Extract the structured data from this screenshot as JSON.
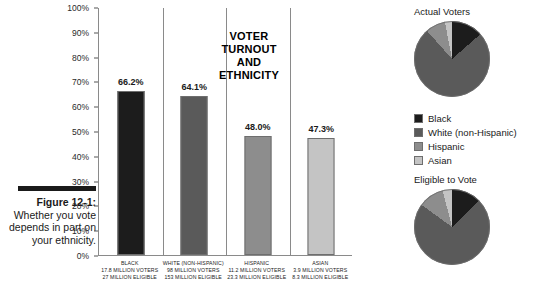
{
  "caption": {
    "figure_label": "Figure 12-1:",
    "text": "Whether you vote depends in part on your ethnicity."
  },
  "chart_title": "VOTER TURNOUT AND ETHNICITY",
  "legend": {
    "items": [
      {
        "label": "Black",
        "color": "#1c1c1c"
      },
      {
        "label": "White (non-Hispanic)",
        "color": "#5a5a5a"
      },
      {
        "label": "Hispanic",
        "color": "#8d8d8d"
      },
      {
        "label": "Asian",
        "color": "#c4c4c4"
      }
    ]
  },
  "pies": [
    {
      "title": "Actual Voters"
    },
    {
      "title": "Eligible to Vote"
    }
  ],
  "chart_data": [
    {
      "type": "bar",
      "title": "VOTER TURNOUT AND ETHNICITY",
      "xlabel": "",
      "ylabel": "",
      "ylim": [
        0,
        100
      ],
      "grid": false,
      "ytick_labels": [
        "100%",
        "90%",
        "80%",
        "70%",
        "60%",
        "50%",
        "40%",
        "30%",
        "20%",
        "10%",
        "0%"
      ],
      "ytick_values": [
        100,
        90,
        80,
        70,
        60,
        50,
        40,
        30,
        20,
        10,
        0
      ],
      "categories": [
        "BLACK",
        "WHITE (NON-HISPANIC)",
        "HISPANIC",
        "ASIAN"
      ],
      "values": [
        66.2,
        64.1,
        48.0,
        47.3
      ],
      "value_labels": [
        "66.2%",
        "64.1%",
        "48.0%",
        "47.3%"
      ],
      "bar_colors": [
        "#1c1c1c",
        "#5a5a5a",
        "#8d8d8d",
        "#c4c4c4"
      ],
      "category_details": [
        {
          "name": "BLACK",
          "voters": "17.8 MILLION VOTERS",
          "eligible": "27 MILLION ELIGIBLE"
        },
        {
          "name": "WHITE (NON-HISPANIC)",
          "voters": "98 MILLION VOTERS",
          "eligible": "153 MILLION ELIGIBLE"
        },
        {
          "name": "HISPANIC",
          "voters": "11.2 MILLION VOTERS",
          "eligible": "23.3 MILLION ELIGIBLE"
        },
        {
          "name": "ASIAN",
          "voters": "3.9 MILLION VOTERS",
          "eligible": "8.3 MILLION ELIGIBLE"
        }
      ]
    },
    {
      "type": "pie",
      "title": "Actual Voters",
      "legend_position": "below",
      "categories": [
        "Black",
        "White (non-Hispanic)",
        "Hispanic",
        "Asian"
      ],
      "values": [
        13.5,
        74.5,
        8.5,
        3.0
      ],
      "colors": [
        "#1c1c1c",
        "#5a5a5a",
        "#8d8d8d",
        "#c4c4c4"
      ]
    },
    {
      "type": "pie",
      "title": "Eligible to Vote",
      "legend_position": "above",
      "categories": [
        "Black",
        "White (non-Hispanic)",
        "Hispanic",
        "Asian"
      ],
      "values": [
        12.8,
        72.2,
        11.0,
        4.0
      ],
      "colors": [
        "#1c1c1c",
        "#5a5a5a",
        "#8d8d8d",
        "#c4c4c4"
      ]
    }
  ]
}
